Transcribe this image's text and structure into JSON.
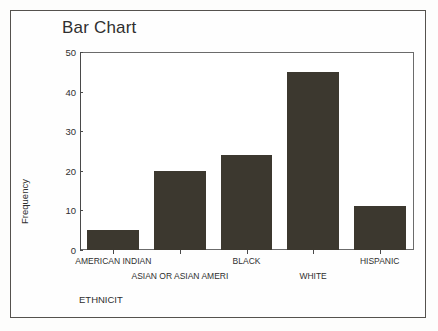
{
  "window": {
    "frame_color": "#55524e",
    "background": "#fefefe"
  },
  "chart_data": {
    "type": "bar",
    "title": "Bar Chart",
    "xlabel": "ETHNICIT",
    "ylabel": "Frequency",
    "categories": [
      "AMERICAN INDIAN",
      "ASIAN OR ASIAN AMERI",
      "BLACK",
      "WHITE",
      "HISPANIC"
    ],
    "values": [
      5,
      20,
      24,
      45,
      11
    ],
    "ylim": [
      0,
      50
    ],
    "yticks": [
      0,
      10,
      20,
      30,
      40,
      50
    ],
    "ytick_labels": [
      "0",
      "10",
      "20",
      "30",
      "40",
      "50"
    ],
    "grid": false,
    "legend": false,
    "bar_color": "#3c382f",
    "axis_color": "#4a4a4a",
    "label_rows": [
      0,
      1,
      0,
      1,
      0
    ]
  }
}
